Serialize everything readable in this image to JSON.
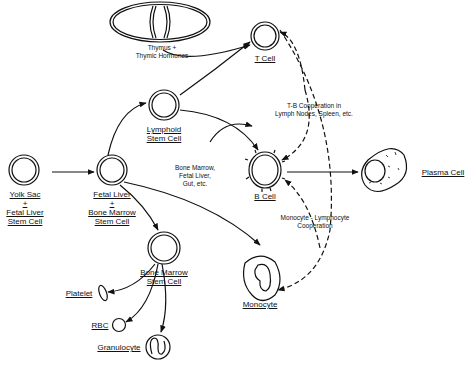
{
  "diagram": {
    "type": "cell-lineage-flowchart",
    "nodes": {
      "yolk_sac": {
        "line1": "Yolk Sac",
        "line2": "+",
        "line3": "Fetal Liver",
        "line4": "Stem Cell"
      },
      "fetal_liver": {
        "line1": "Fetal Liver",
        "line2": "+",
        "line3": "Bone Marrow",
        "line4": "Stem Cell"
      },
      "lymphoid": {
        "line1": "Lymphoid",
        "line2": "Stem Cell"
      },
      "bone_marrow": {
        "line1": "Bone Marrow",
        "line2": "Stem Cell"
      },
      "thymus": {
        "line1": "Thymus +",
        "line2": "Thymic Hormones"
      },
      "t_cell": {
        "label": "T Cell"
      },
      "b_cell": {
        "label": "B Cell"
      },
      "plasma_cell": {
        "label": "Plasma Cell"
      },
      "monocyte": {
        "label": "Monocyte"
      },
      "platelet": {
        "label": "Platelet"
      },
      "rbc": {
        "label": "RBC"
      },
      "granulocyte": {
        "label": "Granulocyte"
      }
    },
    "annotations": {
      "b_source": {
        "line1": "Bone Marrow,",
        "line2": "Fetal Liver,",
        "line3": "Gut, etc."
      },
      "tb_coop": {
        "line1": "T-B Cooperation in",
        "line2": "Lymph Nodes, Spleen, etc."
      },
      "mono_coop": {
        "line1": "Monocyte - Lymphocyte",
        "line2": "Cooperation"
      }
    },
    "colors": {
      "ink": "#111111",
      "background": "#ffffff"
    }
  }
}
